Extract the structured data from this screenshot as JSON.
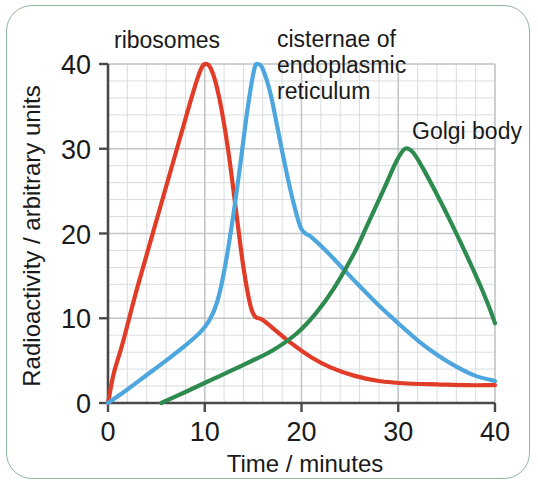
{
  "figure": {
    "border_color": "#8fb79a",
    "background": "#ffffff"
  },
  "axis": {
    "x_title": "Time / minutes",
    "y_title": "Radioactivity / arbitrary units",
    "x_ticks": [
      "0",
      "10",
      "20",
      "30",
      "40"
    ],
    "y_ticks": [
      "0",
      "10",
      "20",
      "30",
      "40"
    ]
  },
  "labels": {
    "ribosomes": "ribosomes",
    "cisternae_line1": "cisternae of",
    "cisternae_line2": "endoplasmic",
    "cisternae_line3": "reticulum",
    "golgi": "Golgi body"
  },
  "chart_data": {
    "type": "line",
    "title": "",
    "xlabel": "Time / minutes",
    "ylabel": "Radioactivity / arbitrary units",
    "xlim": [
      0,
      40
    ],
    "ylim": [
      0,
      40
    ],
    "xticks": [
      0,
      10,
      20,
      30,
      40
    ],
    "yticks": [
      0,
      10,
      20,
      30,
      40
    ],
    "x_minor_step": 2,
    "y_minor_step": 2,
    "grid": true,
    "legend": "inline-annotations",
    "series": [
      {
        "name": "ribosomes",
        "color": "#e03c27",
        "label_x": 10,
        "label_y": 44,
        "points": [
          [
            0.0,
            0.0
          ],
          [
            0.6,
            3.5
          ],
          [
            1.5,
            7.0
          ],
          [
            3.0,
            13.5
          ],
          [
            5.0,
            21.5
          ],
          [
            7.0,
            29.5
          ],
          [
            8.5,
            35.5
          ],
          [
            9.4,
            38.8
          ],
          [
            10.0,
            40.0
          ],
          [
            10.7,
            39.3
          ],
          [
            11.5,
            36.0
          ],
          [
            12.4,
            30.0
          ],
          [
            13.2,
            23.0
          ],
          [
            14.0,
            16.0
          ],
          [
            14.7,
            11.6
          ],
          [
            15.2,
            10.2
          ],
          [
            16.0,
            9.8
          ],
          [
            17.5,
            8.4
          ],
          [
            19.0,
            7.0
          ],
          [
            21.0,
            5.4
          ],
          [
            23.0,
            4.2
          ],
          [
            25.5,
            3.2
          ],
          [
            28.0,
            2.6
          ],
          [
            31.0,
            2.3
          ],
          [
            34.0,
            2.2
          ],
          [
            37.0,
            2.1
          ],
          [
            40.0,
            2.1
          ]
        ]
      },
      {
        "name": "cisternae of endoplasmic reticulum",
        "color": "#4da6dd",
        "label_x": 21,
        "label_y": 44,
        "points": [
          [
            0.0,
            0.0
          ],
          [
            2.0,
            1.6
          ],
          [
            4.0,
            3.3
          ],
          [
            6.0,
            5.0
          ],
          [
            8.0,
            6.8
          ],
          [
            9.5,
            8.3
          ],
          [
            10.5,
            9.8
          ],
          [
            11.3,
            12.0
          ],
          [
            12.0,
            15.5
          ],
          [
            12.8,
            21.0
          ],
          [
            13.6,
            27.5
          ],
          [
            14.4,
            34.5
          ],
          [
            15.1,
            39.3
          ],
          [
            15.5,
            40.0
          ],
          [
            16.0,
            39.4
          ],
          [
            16.8,
            36.5
          ],
          [
            17.6,
            32.0
          ],
          [
            18.4,
            27.5
          ],
          [
            19.2,
            23.5
          ],
          [
            20.0,
            20.5
          ],
          [
            21.0,
            19.6
          ],
          [
            22.5,
            18.0
          ],
          [
            24.0,
            16.2
          ],
          [
            26.0,
            13.8
          ],
          [
            28.0,
            11.5
          ],
          [
            30.0,
            9.4
          ],
          [
            32.0,
            7.4
          ],
          [
            34.0,
            5.7
          ],
          [
            36.0,
            4.3
          ],
          [
            38.0,
            3.2
          ],
          [
            40.0,
            2.6
          ]
        ]
      },
      {
        "name": "Golgi body",
        "color": "#2e8b4f",
        "label_x": 34,
        "label_y": 33,
        "points": [
          [
            5.5,
            0.0
          ],
          [
            8.0,
            1.3
          ],
          [
            11.0,
            2.9
          ],
          [
            14.0,
            4.5
          ],
          [
            17.0,
            6.2
          ],
          [
            19.5,
            8.2
          ],
          [
            21.5,
            10.6
          ],
          [
            23.5,
            13.8
          ],
          [
            25.5,
            17.8
          ],
          [
            27.0,
            21.5
          ],
          [
            28.5,
            25.2
          ],
          [
            29.8,
            28.5
          ],
          [
            30.7,
            30.0
          ],
          [
            31.5,
            29.6
          ],
          [
            32.5,
            27.8
          ],
          [
            34.0,
            24.6
          ],
          [
            35.5,
            21.2
          ],
          [
            37.0,
            17.6
          ],
          [
            38.5,
            13.8
          ],
          [
            39.5,
            11.0
          ],
          [
            40.0,
            9.4
          ]
        ]
      }
    ]
  }
}
